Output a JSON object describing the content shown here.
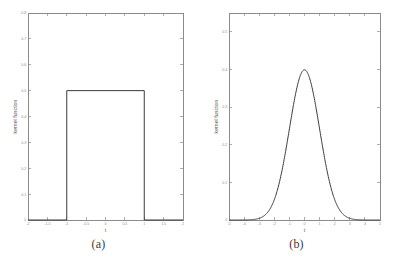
{
  "figure": {
    "panels": [
      {
        "id": "a",
        "caption": "(a)",
        "xlabel": "t",
        "ylabel": "kernel function"
      },
      {
        "id": "b",
        "caption": "(b)",
        "xlabel": "t",
        "ylabel": "kernel function"
      }
    ],
    "line_color": "#3a3a3a",
    "axis_color": "#6e6e6e"
  },
  "chart_data": [
    {
      "type": "line",
      "title": "",
      "panel": "(a)",
      "xlabel": "t",
      "ylabel": "kernel function",
      "xlim": [
        -2,
        2
      ],
      "ylim": [
        0,
        0.8
      ],
      "xticks": [
        -2,
        -1.5,
        -1,
        -0.5,
        0,
        0.5,
        1,
        1.5,
        2
      ],
      "xticklabels": [
        "-2",
        "-1.5",
        "-1",
        "-0.5",
        "0",
        "0.5",
        "1",
        "1.5",
        "2"
      ],
      "yticks": [
        0,
        0.1,
        0.2,
        0.3,
        0.4,
        0.5,
        0.6,
        0.7,
        0.8
      ],
      "yticklabels": [
        "0",
        "0.1",
        "0.2",
        "0.3",
        "0.4",
        "0.5",
        "0.6",
        "0.7",
        "0.8"
      ],
      "grid": false,
      "legend": "none",
      "description": "uniform (rectangular) kernel: 0.5 for |t| <= 1, 0 otherwise",
      "x": [
        -2,
        -1,
        -1,
        1,
        1,
        2
      ],
      "y": [
        0,
        0,
        0.5,
        0.5,
        0,
        0
      ]
    },
    {
      "type": "line",
      "title": "",
      "panel": "(b)",
      "xlabel": "t",
      "ylabel": "kernel function",
      "xlim": [
        -5,
        5
      ],
      "ylim": [
        0,
        0.55
      ],
      "xticks": [
        -5,
        -4,
        -3,
        -2,
        -1,
        0,
        1,
        2,
        3,
        4,
        5
      ],
      "xticklabels": [
        "-5",
        "-4",
        "-3",
        "-2",
        "-1",
        "0",
        "1",
        "2",
        "3",
        "4",
        "5"
      ],
      "yticks": [
        0,
        0.1,
        0.2,
        0.3,
        0.4,
        0.5
      ],
      "yticklabels": [
        "0",
        "0.1",
        "0.2",
        "0.3",
        "0.4",
        "0.5"
      ],
      "grid": false,
      "legend": "none",
      "description": "Gaussian kernel: peak 0.4 at t = 0, standard deviation 1",
      "x": [
        -5,
        -4.5,
        -4,
        -3.5,
        -3,
        -2.5,
        -2,
        -1.5,
        -1,
        -0.5,
        0,
        0.5,
        1,
        1.5,
        2,
        2.5,
        3,
        3.5,
        4,
        4.5,
        5
      ],
      "y": [
        1.5e-06,
        1.6e-05,
        0.0001338,
        0.0008727,
        0.0044318,
        0.0175283,
        0.053991,
        0.1295176,
        0.2419707,
        0.3520653,
        0.3989423,
        0.3520653,
        0.2419707,
        0.1295176,
        0.053991,
        0.0175283,
        0.0044318,
        0.0008727,
        0.0001338,
        1.6e-05,
        1.5e-06
      ]
    }
  ]
}
